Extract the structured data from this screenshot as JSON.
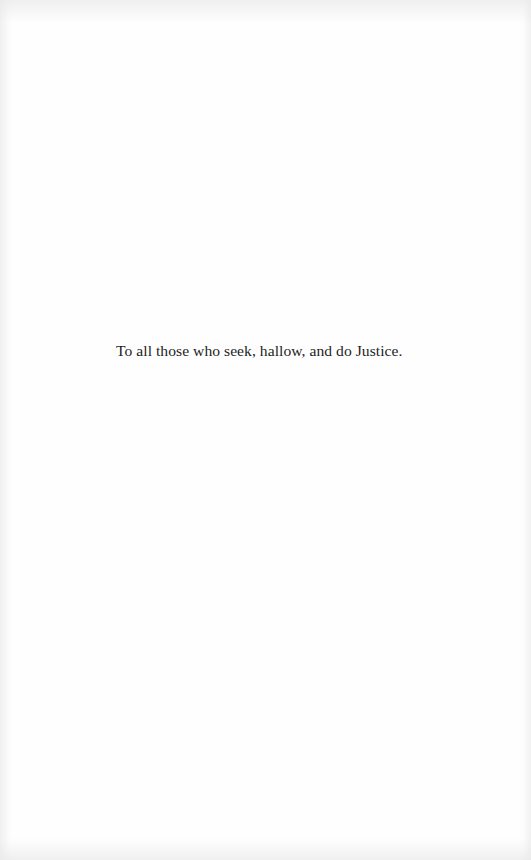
{
  "page": {
    "type": "dedication",
    "background_color": "#fefefe",
    "text_color": "#1e1e1e"
  },
  "dedication": {
    "text": "To all those who seek, hallow, and do Justice."
  }
}
